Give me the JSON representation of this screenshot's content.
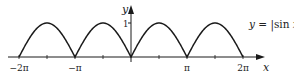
{
  "chart_data": {
    "type": "line",
    "title": "",
    "function_label": "y = |sin x|",
    "xlabel": "x",
    "ylabel": "y",
    "x_ticks": [
      {
        "value": -6.283185,
        "label": "−2π"
      },
      {
        "value": -3.141593,
        "label": "−π"
      },
      {
        "value": 3.141593,
        "label": "π"
      },
      {
        "value": 6.283185,
        "label": "2π"
      }
    ],
    "x_minor_ticks": [
      -4.712389,
      -1.570796,
      1.570796,
      4.712389
    ],
    "y_ticks": [
      {
        "value": 1,
        "label": "1"
      }
    ],
    "xlim": [
      -6.6,
      7.5
    ],
    "ylim": [
      0,
      1.55
    ],
    "grid": false,
    "legend": "none",
    "series": [
      {
        "name": "y = |sin x|",
        "x_range": [
          -6.283185,
          6.283185
        ],
        "x": [
          -6.283,
          -5.498,
          -4.712,
          -3.927,
          -3.142,
          -2.356,
          -1.571,
          -0.785,
          0,
          0.785,
          1.571,
          2.356,
          3.142,
          3.927,
          4.712,
          5.498,
          6.283
        ],
        "y": [
          0,
          0.707,
          1,
          0.707,
          0,
          0.707,
          1,
          0.707,
          0,
          0.707,
          1,
          0.707,
          0,
          0.707,
          1,
          0.707,
          0
        ]
      }
    ]
  },
  "colors": {
    "curve": "#1a1a1a",
    "axis": "#1a1a1a",
    "text": "#222222"
  },
  "labels": {
    "x_axis": "x",
    "y_axis": "y",
    "y_one": "1",
    "neg_two_pi": "−2π",
    "neg_pi": "−π",
    "pi": "π",
    "two_pi": "2π",
    "function_y": "y",
    "function_eq": " = |sin ",
    "function_x": "x",
    "function_bar": "|"
  }
}
